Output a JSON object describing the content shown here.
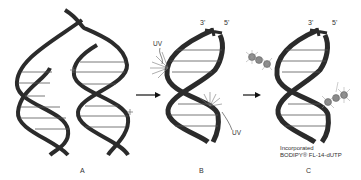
{
  "figure": {
    "panels": [
      {
        "id": "A",
        "label": "A",
        "description": "Two DNA double helices, strands separating"
      },
      {
        "id": "B",
        "label": "B",
        "description": "Single DNA helix with UV-induced strand breaks"
      },
      {
        "id": "C",
        "label": "C",
        "description": "DNA helix with incorporated fluorescent nucleotides at break sites"
      }
    ],
    "strand_ends": {
      "three_prime": "3'",
      "five_prime": "5'"
    },
    "uv_labels": [
      "UV",
      "UV"
    ],
    "caption_c": {
      "line1": "Incorporated",
      "line2": "BODIPY® FL-14-dUTP"
    },
    "arrows": [
      "A-to-B",
      "B-to-C"
    ],
    "colors": {
      "strand": "#2b2b2b",
      "rungs": "#555555",
      "nucleotide": "#8a8a8a",
      "background": "#ffffff"
    }
  }
}
